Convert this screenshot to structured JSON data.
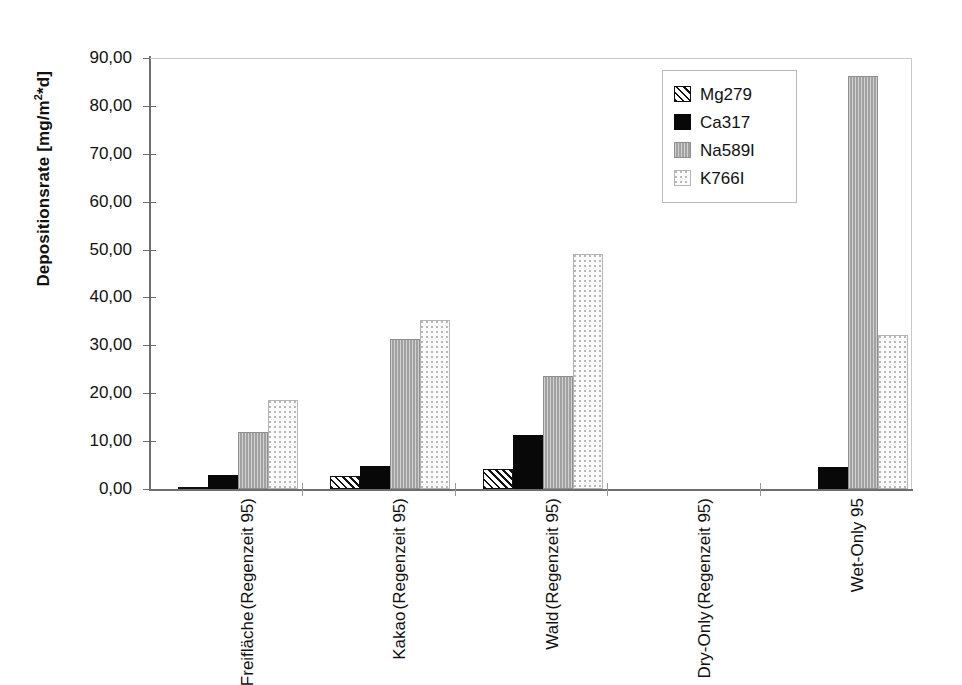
{
  "chart_data": {
    "type": "bar",
    "title": "",
    "subtitle": "",
    "xlabel": "",
    "ylabel": "Depositionsrate [mg/m²*d]",
    "ylabel_parts": {
      "text": "Depositionsrate [mg/m",
      "sup": "2",
      "tail": "*d]"
    },
    "ylim": [
      0,
      90
    ],
    "ytick_values": [
      0,
      10,
      20,
      30,
      40,
      50,
      60,
      70,
      80,
      90
    ],
    "ytick_labels": [
      "0,00",
      "10,00",
      "20,00",
      "30,00",
      "40,00",
      "50,00",
      "60,00",
      "70,00",
      "80,00",
      "90,00"
    ],
    "decimal_separator": ",",
    "grid": false,
    "legend_position": "top-right",
    "categories": [
      {
        "line1": "Freifläche",
        "line2": "(Regenzeit 95)"
      },
      {
        "line1": "Kakao",
        "line2": "(Regenzeit 95)"
      },
      {
        "line1": "Wald",
        "line2": "(Regenzeit 95)"
      },
      {
        "line1": "Dry-Only",
        "line2": "(Regenzeit 95)"
      },
      {
        "line1": "Wet-Only 95",
        "line2": ""
      }
    ],
    "series": [
      {
        "name": "Mg279",
        "pattern": "diagonal-hatch",
        "color": "#111111",
        "values": [
          0.1,
          2.8,
          4.1,
          0,
          0
        ]
      },
      {
        "name": "Ca317",
        "pattern": "solid-black",
        "color": "#080808",
        "values": [
          3.0,
          4.8,
          11.3,
          0,
          4.6
        ]
      },
      {
        "name": "Na589I",
        "pattern": "solid-gray",
        "color": "#ababab",
        "values": [
          12.0,
          31.3,
          23.6,
          0,
          86.2
        ]
      },
      {
        "name": "K766I",
        "pattern": "light-stipple",
        "color": "#fbfbfb",
        "values": [
          18.6,
          35.3,
          49.0,
          0,
          32.2
        ]
      }
    ]
  },
  "legend": {
    "items": [
      {
        "label": "Mg279",
        "swatch": "hatch-swatch"
      },
      {
        "label": "Ca317",
        "swatch": "black-swatch"
      },
      {
        "label": "Na589I",
        "swatch": "gray-swatch"
      },
      {
        "label": "K766I",
        "swatch": "dotted-swatch"
      }
    ]
  },
  "colors": {
    "axis": "#6e6e6e",
    "plot_border": "#c9c9c9",
    "text": "#111111",
    "background": "#ffffff"
  }
}
